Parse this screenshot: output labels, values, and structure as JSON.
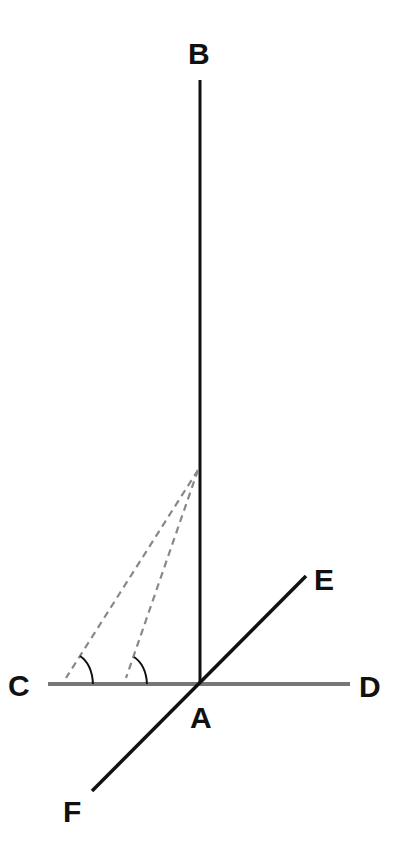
{
  "diagram": {
    "type": "geometry",
    "points": {
      "A": {
        "label": "A",
        "x": 200,
        "y": 684
      },
      "B": {
        "label": "B",
        "x": 200,
        "y": 80
      },
      "C": {
        "label": "C",
        "x": 48,
        "y": 684
      },
      "D": {
        "label": "D",
        "x": 350,
        "y": 684
      },
      "E": {
        "label": "E",
        "x": 306,
        "y": 576
      },
      "F": {
        "label": "F",
        "x": 92,
        "y": 791
      },
      "P": {
        "label": "",
        "x": 198,
        "y": 470
      }
    },
    "labels": {
      "A": "A",
      "B": "B",
      "C": "C",
      "D": "D",
      "E": "E",
      "F": "F"
    },
    "segments": [
      {
        "from": "A",
        "to": "B",
        "style": "solid",
        "color": "#111111"
      },
      {
        "from": "C",
        "to": "D",
        "style": "solid",
        "color": "#777777"
      },
      {
        "from": "E",
        "to": "F",
        "style": "solid",
        "color": "#111111"
      },
      {
        "from": "P",
        "to": "C1",
        "style": "dashed",
        "color": "#888888"
      },
      {
        "from": "P",
        "to": "C2",
        "style": "dashed",
        "color": "#888888"
      }
    ],
    "angle_marks": 2,
    "colors": {
      "ink": "#111111",
      "horizontal_line": "#777777",
      "dashed": "#888888",
      "background": "#ffffff"
    }
  }
}
